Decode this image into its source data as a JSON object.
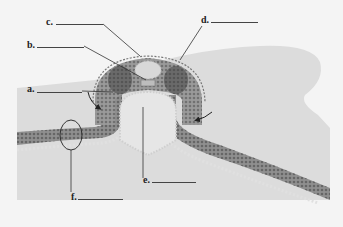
{
  "figure": {
    "type": "biology-diagram",
    "colors": {
      "background": "#f4f4f4",
      "tissue_back": "#d6d6d6",
      "tissue_band": "#8a8a8a",
      "dot_dark": "#555555",
      "dot_light": "#e8e8e8",
      "leader_line": "#333333"
    },
    "labels": [
      {
        "id": "a",
        "text": "a."
      },
      {
        "id": "b",
        "text": "b."
      },
      {
        "id": "c",
        "text": "c."
      },
      {
        "id": "d",
        "text": "d."
      },
      {
        "id": "e",
        "text": "e."
      },
      {
        "id": "f",
        "text": "f."
      }
    ],
    "annotations": {
      "arrows": [
        "left-inward-arrow",
        "right-inward-arrow"
      ],
      "highlight": "circled-layer-region"
    }
  }
}
